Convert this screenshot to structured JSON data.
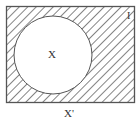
{
  "diagram": {
    "type": "venn",
    "universe_label": "I",
    "set_label": "X",
    "caption": "X'",
    "shaded_region": "complement of X",
    "colors": {
      "stroke": "#555555",
      "hatch": "#666666",
      "background": "#ffffff"
    }
  }
}
